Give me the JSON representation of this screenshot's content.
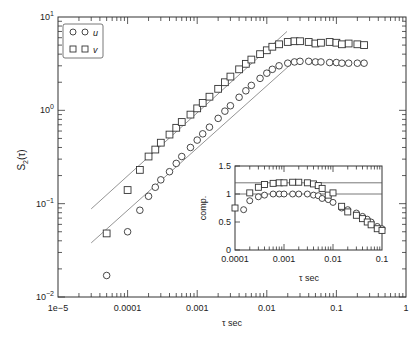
{
  "chart_data": [
    {
      "type": "scatter",
      "title": "",
      "xlabel": "τ sec",
      "ylabel": "S2(τ)",
      "xscale": "log",
      "yscale": "log",
      "xlim": [
        1e-05,
        1
      ],
      "ylim": [
        0.01,
        10
      ],
      "x_tick_labels": [
        "1e−5",
        "0.0001",
        "0.001",
        "0.01",
        "0.1",
        "1"
      ],
      "y_tick_labels": [
        "10^-2",
        "10^-1",
        "10^0",
        "10^1"
      ],
      "grid": false,
      "legend": {
        "position": "upper left",
        "entries": [
          {
            "marker": "circle",
            "label": "u"
          },
          {
            "marker": "square",
            "label": "v"
          }
        ]
      },
      "series": [
        {
          "name": "u",
          "marker": "circle",
          "x": [
            5e-05,
            0.0001,
            0.00015,
            0.0002,
            0.00025,
            0.0003,
            0.0004,
            0.0005,
            0.0006,
            0.0008,
            0.001,
            0.0012,
            0.0015,
            0.002,
            0.0025,
            0.003,
            0.004,
            0.005,
            0.006,
            0.008,
            0.01,
            0.012,
            0.015,
            0.02,
            0.025,
            0.03,
            0.04,
            0.05,
            0.06,
            0.08,
            0.1,
            0.12,
            0.15,
            0.2,
            0.25
          ],
          "values": [
            0.017,
            0.05,
            0.085,
            0.12,
            0.15,
            0.18,
            0.22,
            0.27,
            0.32,
            0.4,
            0.48,
            0.56,
            0.66,
            0.82,
            0.98,
            1.12,
            1.38,
            1.62,
            1.85,
            2.2,
            2.5,
            2.75,
            3.0,
            3.2,
            3.3,
            3.35,
            3.35,
            3.3,
            3.3,
            3.25,
            3.25,
            3.2,
            3.2,
            3.2,
            3.2
          ]
        },
        {
          "name": "v",
          "marker": "square",
          "x": [
            5e-05,
            0.0001,
            0.00015,
            0.0002,
            0.00025,
            0.0003,
            0.0004,
            0.0005,
            0.0006,
            0.0008,
            0.001,
            0.0012,
            0.0015,
            0.002,
            0.0025,
            0.003,
            0.004,
            0.005,
            0.006,
            0.008,
            0.01,
            0.012,
            0.015,
            0.02,
            0.025,
            0.03,
            0.04,
            0.05,
            0.06,
            0.08,
            0.1,
            0.12,
            0.15,
            0.2,
            0.25
          ],
          "values": [
            0.048,
            0.14,
            0.23,
            0.32,
            0.38,
            0.45,
            0.55,
            0.65,
            0.75,
            0.9,
            1.05,
            1.2,
            1.4,
            1.7,
            2.0,
            2.3,
            2.75,
            3.15,
            3.5,
            4.0,
            4.4,
            4.8,
            5.1,
            5.4,
            5.5,
            5.5,
            5.4,
            5.2,
            5.3,
            5.4,
            5.3,
            5.1,
            5.2,
            5.1,
            5.0
          ]
        }
      ],
      "reference_lines": [
        {
          "name": "upper-slope",
          "x": [
            3e-05,
            0.0195
          ],
          "y": [
            0.088,
            7.0
          ]
        },
        {
          "name": "lower-slope",
          "x": [
            3e-05,
            0.022
          ],
          "y": [
            0.038,
            3.1
          ]
        }
      ]
    },
    {
      "type": "scatter",
      "title": "inset",
      "xlabel": "τ sec",
      "ylabel": "comp.",
      "xscale": "log",
      "yscale": "linear",
      "xlim": [
        0.0001,
        0.1
      ],
      "ylim": [
        0,
        1.5
      ],
      "x_tick_labels": [
        "0.0001",
        "0.001",
        "0.01",
        "0.1"
      ],
      "y_tick_labels": [
        "0",
        "0.5",
        "1",
        "1.5"
      ],
      "hlines": [
        1.0,
        1.2
      ],
      "series": [
        {
          "name": "u",
          "marker": "circle",
          "x": [
            0.00015,
            0.0002,
            0.0003,
            0.0004,
            0.0006,
            0.0008,
            0.001,
            0.0015,
            0.002,
            0.003,
            0.004,
            0.005,
            0.006,
            0.008,
            0.01,
            0.015,
            0.02,
            0.03,
            0.04,
            0.05,
            0.06,
            0.08,
            0.1
          ],
          "values": [
            0.72,
            0.88,
            0.95,
            0.98,
            1.0,
            1.0,
            1.0,
            1.0,
            1.0,
            1.0,
            0.98,
            0.97,
            0.92,
            0.9,
            0.85,
            0.75,
            0.72,
            0.66,
            0.6,
            0.55,
            0.5,
            0.42,
            0.38
          ]
        },
        {
          "name": "v",
          "marker": "square",
          "x": [
            0.0001,
            0.0002,
            0.0003,
            0.0004,
            0.0006,
            0.0008,
            0.001,
            0.0015,
            0.002,
            0.003,
            0.004,
            0.005,
            0.006,
            0.008,
            0.01,
            0.015,
            0.02,
            0.03,
            0.04,
            0.05,
            0.06,
            0.08,
            0.1
          ],
          "values": [
            0.75,
            1.02,
            1.12,
            1.17,
            1.19,
            1.2,
            1.2,
            1.21,
            1.21,
            1.2,
            1.18,
            1.15,
            1.1,
            0.98,
            1.02,
            0.78,
            0.68,
            0.62,
            0.56,
            0.5,
            0.45,
            0.38,
            0.35
          ]
        }
      ]
    }
  ],
  "labels": {
    "main_xlabel": "τ sec",
    "main_ylabel_base": "S",
    "main_ylabel_sub": "2",
    "main_ylabel_arg": "(τ)",
    "legend_u": "u",
    "legend_v": "v",
    "inset_xlabel": "τ sec",
    "inset_ylabel": "comp."
  }
}
